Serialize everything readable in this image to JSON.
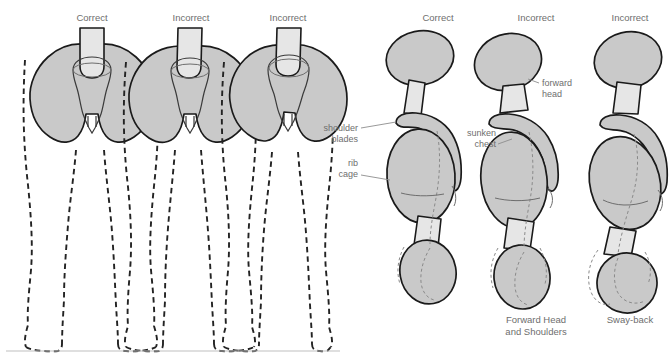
{
  "figure": {
    "background": "#ffffff",
    "colors": {
      "bone_fill": "#c9c9c9",
      "bone_fill_light": "#e6e6e6",
      "outline": "#1a1a1a",
      "text": "#6e6e6e",
      "dashed_body": "#232323",
      "ground_line": "#c0c0c0",
      "leader_line": "#8d8d8d"
    }
  },
  "left_panel": {
    "name": "pelvis-front-view-panel",
    "view": "front",
    "figures": [
      {
        "id": "front-correct",
        "caption": "Correct",
        "description": "level pelvis, symmetric legs"
      },
      {
        "id": "front-incorrect-1",
        "caption": "Incorrect",
        "description": "pelvis rotated, knees drawn inward"
      },
      {
        "id": "front-incorrect-2",
        "caption": "Incorrect",
        "description": "pelvis tilted laterally, uneven legs"
      }
    ],
    "ground_label": ""
  },
  "right_panel": {
    "name": "posture-side-view-panel",
    "view": "side",
    "figures": [
      {
        "id": "side-correct",
        "caption_top": "Correct",
        "caption_bottom": "",
        "annotations": [
          "shoulder blades",
          "rib cage"
        ]
      },
      {
        "id": "side-forward-head",
        "caption_top": "Incorrect",
        "caption_bottom": "Forward Head and Shoulders",
        "annotations": [
          "forward head",
          "sunken chest"
        ]
      },
      {
        "id": "side-sway-back",
        "caption_top": "Incorrect",
        "caption_bottom": "Sway-back",
        "annotations": []
      }
    ]
  },
  "annotations": {
    "shoulder_blades_line1": "shoulder",
    "shoulder_blades_line2": "blades",
    "rib_cage_line1": "rib",
    "rib_cage_line2": "cage",
    "forward_head_line1": "forward",
    "forward_head_line2": "head",
    "sunken_chest_line1": "sunken",
    "sunken_chest_line2": "chest"
  },
  "captions": {
    "correct": "Correct",
    "incorrect": "Incorrect",
    "forward_head_shoulders_line1": "Forward Head",
    "forward_head_shoulders_line2": "and Shoulders",
    "sway_back": "Sway-back"
  }
}
